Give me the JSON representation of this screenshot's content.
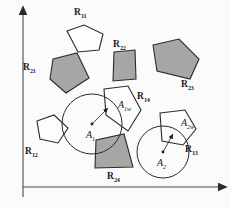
{
  "figure": {
    "background_color": "#fdfdfd",
    "stroke_color": "#2b2b2b",
    "fill_gray": "#a8a8a8",
    "fill_white": "#ffffff",
    "axes": {
      "x_axis_name": "horizontal-axis",
      "y_axis_name": "vertical-axis",
      "x_axis_arrow": "arrow-right",
      "y_axis_arrow": "arrow-up",
      "x_axis_label": "",
      "y_axis_label": ""
    },
    "regions": [
      {
        "id": "R11",
        "base": "R",
        "sub": "11",
        "fill": "white",
        "label_x": 74,
        "label_y": 8
      },
      {
        "id": "R12",
        "base": "R",
        "sub": "12",
        "fill": "white",
        "label_x": 25,
        "label_y": 147
      },
      {
        "id": "R13",
        "base": "R",
        "sub": "13",
        "fill": "white",
        "label_x": 185,
        "label_y": 145
      },
      {
        "id": "R14",
        "base": "R",
        "sub": "14",
        "fill": "white",
        "label_x": 137,
        "label_y": 92
      },
      {
        "id": "R21",
        "base": "R",
        "sub": "21",
        "fill": "gray",
        "label_x": 23,
        "label_y": 63
      },
      {
        "id": "R22",
        "base": "R",
        "sub": "22",
        "fill": "gray",
        "label_x": 113,
        "label_y": 40
      },
      {
        "id": "R23",
        "base": "R",
        "sub": "23",
        "fill": "gray",
        "label_x": 181,
        "label_y": 80
      },
      {
        "id": "R24",
        "base": "R",
        "sub": "24",
        "fill": "gray",
        "label_x": 107,
        "label_y": 172
      }
    ],
    "circles": [
      {
        "id": "A1",
        "center_label_base": "A",
        "center_label_sub": "1",
        "center_x": 92,
        "center_y": 124,
        "radius": 30,
        "center_label_x": 86,
        "center_label_y": 130,
        "overlap_label_base": "A",
        "overlap_label_sub": "1w",
        "overlap_label_x": 118,
        "overlap_label_y": 100,
        "arrow_tip_x": 108,
        "arrow_tip_y": 108
      },
      {
        "id": "A2",
        "center_label_base": "A",
        "center_label_sub": "2",
        "center_x": 163,
        "center_y": 152,
        "radius": 26,
        "center_label_x": 157,
        "center_label_y": 158,
        "overlap_label_base": "A",
        "overlap_label_sub": "2w",
        "overlap_label_x": 181,
        "overlap_label_y": 118,
        "arrow_tip_x": 173,
        "arrow_tip_y": 134
      }
    ],
    "shapes": {
      "R11_points": "67,31 84,25 103,34 99,50 78,52",
      "R12_points": "37,121 54,115 68,128 58,143 40,139",
      "R13_points": "160,113 185,110 196,129 183,145 162,141",
      "R14_points": "104,89 128,86 141,110 128,131 106,115",
      "R21_points": "53,59 77,53 89,78 66,93 50,79",
      "R22_points": "114,52 135,50 136,79 113,81",
      "R23_points": "153,45 179,39 199,59 190,79 157,71",
      "R24_points": "96,140 124,134 133,167 95,168"
    }
  }
}
